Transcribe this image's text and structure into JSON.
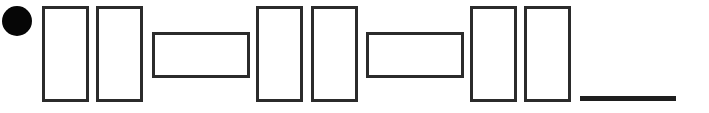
{
  "figure": {
    "width": 709,
    "height": 113,
    "background_color": "#ffffff",
    "stroke_color": "#2b2b2b",
    "fill_color": "#000000"
  },
  "shapes": [
    {
      "index": 1,
      "name": "bullet-circle",
      "type": "circle",
      "fill": "#060606",
      "stroke": "none",
      "stroke_width": 0,
      "x": 2,
      "y": 6,
      "width": 30,
      "height": 30
    },
    {
      "index": 2,
      "name": "tall-rect-1",
      "type": "rectangle",
      "fill": "none",
      "stroke": "#2b2b2b",
      "stroke_width": 3,
      "x": 42,
      "y": 6,
      "width": 47,
      "height": 96
    },
    {
      "index": 3,
      "name": "tall-rect-2",
      "type": "rectangle",
      "fill": "none",
      "stroke": "#2b2b2b",
      "stroke_width": 3,
      "x": 96,
      "y": 6,
      "width": 47,
      "height": 96
    },
    {
      "index": 4,
      "name": "wide-rect-1",
      "type": "rectangle",
      "fill": "none",
      "stroke": "#2b2b2b",
      "stroke_width": 3,
      "x": 152,
      "y": 32,
      "width": 98,
      "height": 46
    },
    {
      "index": 5,
      "name": "tall-rect-3",
      "type": "rectangle",
      "fill": "none",
      "stroke": "#2b2b2b",
      "stroke_width": 3,
      "x": 256,
      "y": 6,
      "width": 47,
      "height": 96
    },
    {
      "index": 6,
      "name": "tall-rect-4",
      "type": "rectangle",
      "fill": "none",
      "stroke": "#2b2b2b",
      "stroke_width": 3,
      "x": 311,
      "y": 6,
      "width": 47,
      "height": 96
    },
    {
      "index": 7,
      "name": "wide-rect-2",
      "type": "rectangle",
      "fill": "none",
      "stroke": "#2b2b2b",
      "stroke_width": 3,
      "x": 366,
      "y": 32,
      "width": 98,
      "height": 46
    },
    {
      "index": 8,
      "name": "tall-rect-5",
      "type": "rectangle",
      "fill": "none",
      "stroke": "#2b2b2b",
      "stroke_width": 3,
      "x": 470,
      "y": 6,
      "width": 47,
      "height": 96
    },
    {
      "index": 9,
      "name": "tall-rect-6",
      "type": "rectangle",
      "fill": "none",
      "stroke": "#2b2b2b",
      "stroke_width": 3,
      "x": 524,
      "y": 6,
      "width": 47,
      "height": 96
    },
    {
      "index": 10,
      "name": "baseline-rule",
      "type": "line",
      "fill": "#1e1e1e",
      "stroke": "#1e1e1e",
      "stroke_width": 5,
      "x": 580,
      "y": 96,
      "width": 96,
      "height": 5
    }
  ]
}
